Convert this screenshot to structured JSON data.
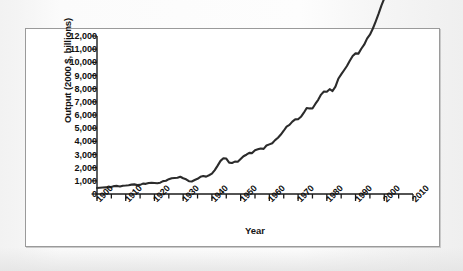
{
  "figure": {
    "line_color": "#2b2b2b",
    "axis_color": "#1a1a1a",
    "frame_color": "#9a9a9a",
    "background": "#ffffff"
  },
  "chart_data": {
    "type": "line",
    "title": "",
    "xlabel": "Year",
    "ylabel": "Output (2000 $, billions)",
    "xlim": [
      1900,
      2010
    ],
    "ylim": [
      0,
      12000
    ],
    "grid": false,
    "legend": null,
    "x_tick_labels": [
      "1900",
      "1910",
      "1920",
      "1930",
      "1940",
      "1950",
      "1960",
      "1970",
      "1980",
      "1990",
      "2000",
      "2010"
    ],
    "x_major_ticks": [
      1900,
      1910,
      1920,
      1930,
      1940,
      1950,
      1960,
      1970,
      1980,
      1990,
      2000,
      2010
    ],
    "x_minor_tick_step": 5,
    "y_tick_labels": [
      "0",
      "1,000",
      "2,000",
      "3,000",
      "4,000",
      "5,000",
      "6,000",
      "7,000",
      "8,000",
      "9,000",
      "10,000",
      "11,000",
      "12,000"
    ],
    "y_major_ticks": [
      0,
      1000,
      2000,
      3000,
      4000,
      5000,
      6000,
      7000,
      8000,
      9000,
      10000,
      11000,
      12000
    ],
    "series": [
      {
        "name": "Real GDP (output)",
        "x": [
          1900,
          1901,
          1902,
          1903,
          1904,
          1905,
          1906,
          1907,
          1908,
          1909,
          1910,
          1911,
          1912,
          1913,
          1914,
          1915,
          1916,
          1917,
          1918,
          1919,
          1920,
          1921,
          1922,
          1923,
          1924,
          1925,
          1926,
          1927,
          1928,
          1929,
          1930,
          1931,
          1932,
          1933,
          1934,
          1935,
          1936,
          1937,
          1938,
          1939,
          1940,
          1941,
          1942,
          1943,
          1944,
          1945,
          1946,
          1947,
          1948,
          1949,
          1950,
          1951,
          1952,
          1953,
          1954,
          1955,
          1956,
          1957,
          1958,
          1959,
          1960,
          1961,
          1962,
          1963,
          1964,
          1965,
          1966,
          1967,
          1968,
          1969,
          1970,
          1971,
          1972,
          1973,
          1974,
          1975,
          1976,
          1977,
          1978,
          1979,
          1980,
          1981,
          1982,
          1983,
          1984,
          1985,
          1986,
          1987,
          1988,
          1989,
          1990,
          1991,
          1992,
          1993,
          1994,
          1995,
          1996,
          1997,
          1998,
          1999,
          2000,
          2001,
          2002,
          2003,
          2004,
          2005,
          2006,
          2007
        ],
        "values": [
          460,
          475,
          490,
          505,
          500,
          540,
          600,
          615,
          565,
          630,
          645,
          665,
          710,
          730,
          675,
          690,
          790,
          770,
          835,
          845,
          835,
          815,
          860,
          975,
          1005,
          1125,
          1200,
          1215,
          1230,
          1310,
          1195,
          1115,
          970,
          955,
          1060,
          1155,
          1305,
          1370,
          1320,
          1425,
          1545,
          1815,
          2155,
          2515,
          2715,
          2690,
          2385,
          2360,
          2460,
          2445,
          2660,
          2870,
          2985,
          3125,
          3105,
          3320,
          3390,
          3460,
          3430,
          3680,
          3770,
          3860,
          4090,
          4270,
          4515,
          4805,
          5120,
          5250,
          5500,
          5670,
          5680,
          5865,
          6175,
          6530,
          6500,
          6490,
          6840,
          7155,
          7550,
          7790,
          7770,
          7960,
          7820,
          8160,
          8750,
          9080,
          9400,
          9720,
          10120,
          10480,
          10680,
          10660,
          11030,
          11340,
          11800,
          12100,
          12550,
          13100,
          13680,
          14310,
          14850,
          14990,
          15260,
          15700,
          16290,
          16800,
          17300,
          17700
        ]
      }
    ]
  }
}
